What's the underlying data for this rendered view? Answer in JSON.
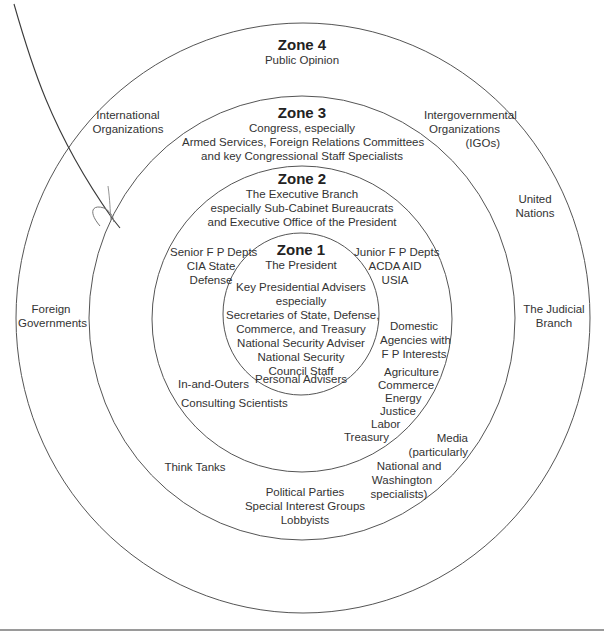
{
  "diagram": {
    "type": "concentric-zones",
    "zones": [
      {
        "id": "zone4",
        "title": "Zone 4",
        "subtitle": "Public Opinion",
        "items": {
          "international_organizations": [
            "International",
            "Organizations"
          ],
          "igos": [
            "Intergovernmental",
            "Organizations",
            "(IGOs)"
          ],
          "foreign_governments": [
            "Foreign",
            "Governments"
          ],
          "united_nations": [
            "United",
            "Nations"
          ],
          "judicial_branch": [
            "The Judicial",
            "Branch"
          ]
        }
      },
      {
        "id": "zone3",
        "title": "Zone 3",
        "subtitle_lines": [
          "Congress, especially",
          "Armed Services, Foreign Relations Committees",
          "and key Congressional Staff Specialists"
        ],
        "items": {
          "think_tanks": "Think Tanks",
          "political": [
            "Political Parties",
            "Special Interest Groups",
            "Lobbyists"
          ],
          "media": [
            "Media",
            "(particularly",
            "National and",
            "Washington",
            "specialists)"
          ]
        }
      },
      {
        "id": "zone2",
        "title": "Zone 2",
        "subtitle_lines": [
          "The Executive Branch",
          "especially Sub-Cabinet Bureaucrats",
          "and Executive Office of the President"
        ],
        "items": {
          "senior_depts": [
            "Senior F P Depts",
            "CIA State",
            "Defense"
          ],
          "junior_depts": [
            "Junior F P Depts",
            "ACDA AID",
            "USIA"
          ],
          "domestic_agencies": [
            "Domestic",
            "Agencies with",
            "F P Interests"
          ],
          "domestic_list": [
            "Agriculture",
            "Commerce",
            "Energy",
            "Justice",
            "Labor",
            "Treasury"
          ],
          "in_and_outers": "In-and-Outers",
          "consulting_scientists": "Consulting Scientists"
        }
      },
      {
        "id": "zone1",
        "title": "Zone 1",
        "subtitle": "The President",
        "advisers_lines": [
          "Key Presidential Advisers",
          "especially",
          "Secretaries of State, Defense,",
          "Commerce, and Treasury",
          "National Security Adviser",
          "National Security",
          "Council Staff"
        ],
        "personal_advisers": "Personal Advisers"
      }
    ],
    "colors": {
      "line": "#555555",
      "pen": "#3a3a3a",
      "rule": "#9a9a9a",
      "text": "#333333"
    }
  }
}
